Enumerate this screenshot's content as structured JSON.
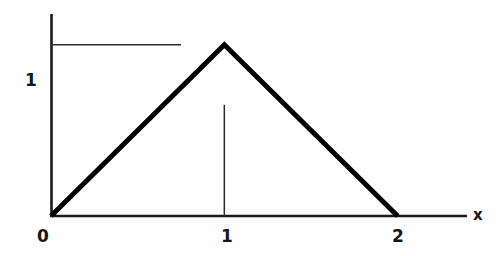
{
  "figure": {
    "background_color": "#fefefe",
    "width": 502,
    "height": 256
  },
  "axes": {
    "x_axis_label": "x",
    "y_axis_label": "",
    "axis_color": "#1a1a1a",
    "origin_px": [
      51,
      216
    ],
    "x_axis_end_px": [
      467,
      216
    ],
    "y_axis_top_px": [
      51,
      14
    ]
  },
  "labels": {
    "y_one": "1",
    "x_zero": "0",
    "x_one": "1",
    "x_two": "2",
    "axis_x": "x"
  },
  "guides": {
    "horizontal_guide_value": 1,
    "vertical_guide_value": 1,
    "guide_color": "#2b2b2b"
  },
  "chart_data": {
    "type": "line",
    "title": "",
    "subtitle": "",
    "xlabel": "x",
    "ylabel": "",
    "xlim": [
      0,
      2.4
    ],
    "ylim": [
      0,
      1.18
    ],
    "grid": false,
    "legend": null,
    "xticks": [
      0,
      1,
      2
    ],
    "xticklabels": [
      "0",
      "1",
      "2"
    ],
    "yticks": [
      1
    ],
    "yticklabels": [
      "1"
    ],
    "series": [
      {
        "name": "triangular function",
        "x": [
          0,
          1,
          2
        ],
        "y": [
          0,
          1,
          0
        ],
        "color": "#000000",
        "linewidth": 5
      }
    ],
    "annotations": [
      {
        "kind": "horizontal-guide",
        "y": 1,
        "x_start": 0,
        "x_end": 0.75,
        "linewidth": 1
      },
      {
        "kind": "vertical-guide",
        "x": 1,
        "y_start": 0,
        "y_end": 0.65,
        "linewidth": 1
      }
    ]
  }
}
